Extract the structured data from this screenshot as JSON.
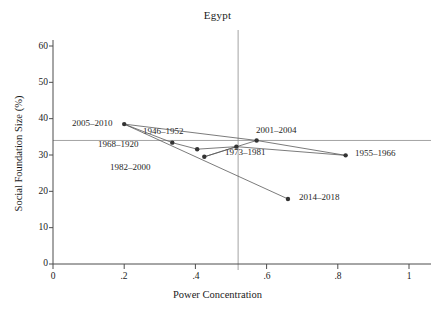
{
  "chart_data": {
    "type": "scatter",
    "title": "Egypt",
    "xlabel": "Power Concentration",
    "ylabel": "Social Foundation Size (%)",
    "xlim": [
      0,
      1
    ],
    "ylim": [
      0,
      63
    ],
    "xticks": [
      "0",
      ".2",
      ".4",
      ".6",
      ".8",
      "1"
    ],
    "xtick_values": [
      0,
      0.2,
      0.4,
      0.6,
      0.8,
      1
    ],
    "yticks": [
      "0",
      "10",
      "20",
      "30",
      "40",
      "50",
      "60"
    ],
    "ytick_values": [
      0,
      10,
      20,
      30,
      40,
      50,
      60
    ],
    "grid": false,
    "legend": "none",
    "reference_lines": {
      "horizontal_y": 34.0,
      "vertical_x": 0.52
    },
    "marker_color": "#333333",
    "line_color": "#595959",
    "axis_color": "#4d4d4d",
    "points": [
      {
        "label": "2005–2010",
        "x": 0.2,
        "y": 38.5,
        "label_side": "left"
      },
      {
        "label": "1946–1952",
        "x": 0.335,
        "y": 33.4,
        "label_side": "right"
      },
      {
        "label": "1968–1920",
        "x": 0.405,
        "y": 31.6,
        "label_side": "left"
      },
      {
        "label": "1982–2000",
        "x": 0.425,
        "y": 29.5,
        "label_side": "left"
      },
      {
        "label": "1973–1981",
        "x": 0.515,
        "y": 32.3,
        "label_side": "right"
      },
      {
        "label": "2001–2004",
        "x": 0.572,
        "y": 34.0,
        "label_side": "right"
      },
      {
        "label": "1955–1966",
        "x": 0.822,
        "y": 29.9,
        "label_side": "right"
      },
      {
        "label": "2014–2018",
        "x": 0.66,
        "y": 17.9,
        "label_side": "right"
      }
    ],
    "connections": [
      [
        "2005–2010",
        "1946–1952"
      ],
      [
        "1946–1952",
        "1968–1920"
      ],
      [
        "1968–1920",
        "1973–1981"
      ],
      [
        "1973–1981",
        "1982–2000"
      ],
      [
        "1982–2000",
        "2001–2004"
      ],
      [
        "2001–2004",
        "1955–1966"
      ],
      [
        "1955–1966",
        "1973–1981"
      ],
      [
        "2005–2010",
        "2014–2018"
      ],
      [
        "2001–2004",
        "2005–2010"
      ]
    ]
  }
}
